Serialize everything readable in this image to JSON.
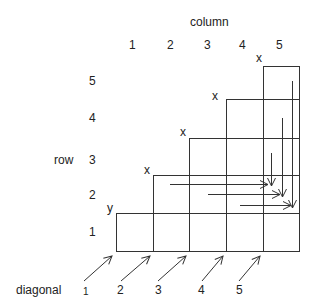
{
  "title": "column",
  "row_axis_label": "row",
  "diagonal_axis_label": "diagonal",
  "column_labels": [
    "1",
    "2",
    "3",
    "4",
    "5"
  ],
  "row_labels": [
    "1",
    "2",
    "3",
    "4",
    "5"
  ],
  "diagonal_labels": [
    "1",
    "2",
    "3",
    "4",
    "5"
  ],
  "corner_markers": {
    "y_marker": "y",
    "x_markers": [
      "x",
      "x",
      "x",
      "x"
    ]
  },
  "colors": {
    "line": "#333333",
    "text": "#222222",
    "background": "#ffffff"
  }
}
